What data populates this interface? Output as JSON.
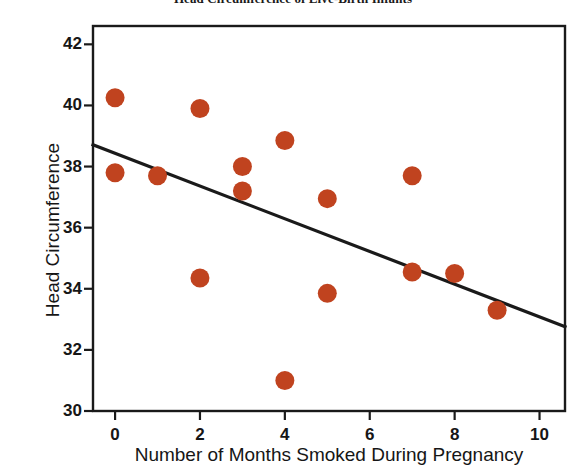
{
  "chart_data": {
    "type": "scatter",
    "title": "Head Circumference of Live-Birth Infants",
    "xlabel": "Number of Months Smoked During Pregnancy",
    "ylabel": "Head Circumference",
    "xlim": [
      -0.52,
      10.6
    ],
    "ylim": [
      30,
      42.6
    ],
    "xticks": [
      0,
      2,
      4,
      6,
      8,
      10
    ],
    "yticks": [
      30,
      32,
      34,
      36,
      38,
      40,
      42
    ],
    "grid": false,
    "legend": false,
    "marker_color": "#C0431F",
    "line_color": "#1A1A1A",
    "axis_color": "#1A1A1A",
    "points": [
      {
        "x": 0,
        "y": 40.25
      },
      {
        "x": 0,
        "y": 37.8
      },
      {
        "x": 1,
        "y": 37.7
      },
      {
        "x": 2,
        "y": 39.9
      },
      {
        "x": 2,
        "y": 34.35
      },
      {
        "x": 3,
        "y": 38.0
      },
      {
        "x": 3,
        "y": 37.2
      },
      {
        "x": 4,
        "y": 38.85
      },
      {
        "x": 4,
        "y": 31.0
      },
      {
        "x": 5,
        "y": 36.95
      },
      {
        "x": 5,
        "y": 33.85
      },
      {
        "x": 7,
        "y": 37.7
      },
      {
        "x": 7,
        "y": 34.55
      },
      {
        "x": 8,
        "y": 34.5
      },
      {
        "x": 9,
        "y": 33.3
      }
    ],
    "trendline": {
      "name": "least-squares regression line",
      "slope": -0.535,
      "intercept": 38.43,
      "x_start": -0.52,
      "x_end": 10.6,
      "y_start": 38.71,
      "y_end": 32.76
    }
  },
  "axes": {
    "y_tick_labels": [
      "42",
      "40",
      "38",
      "36",
      "34",
      "32",
      "30"
    ],
    "x_tick_labels": [
      "0",
      "2",
      "4",
      "6",
      "8",
      "10"
    ]
  }
}
